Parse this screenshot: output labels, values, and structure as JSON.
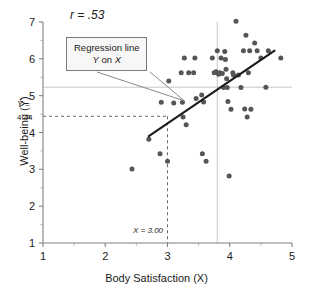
{
  "chart_data": {
    "type": "scatter",
    "title": "",
    "xlabel": "Body Satisfaction (X)",
    "ylabel": "Well-being (Y)",
    "xlim": [
      1,
      5
    ],
    "ylim": [
      1,
      7
    ],
    "xticks": [
      "1",
      "2",
      "3",
      "4",
      "5"
    ],
    "yticks": [
      "1",
      "2",
      "3",
      "4",
      "5",
      "6",
      "7"
    ],
    "grid": false,
    "legend": "none",
    "correlation_label": "r = .53",
    "correlation_value": 0.53,
    "annotations": {
      "callout_line1": "Regression line",
      "callout_line2_prefix": "Y",
      "callout_line2_mid": " on ",
      "callout_line2_suffix": "X",
      "yhat_label": "Ŷ =",
      "yhat_value": "4.44",
      "x_label": "X = 3.00",
      "x_value": 3.0,
      "yhat_numeric": 4.44
    },
    "reference_lines": {
      "dashed_vertical_x": 3.0,
      "dashed_horizontal_y": 4.44,
      "gray_vertical_x": 3.8,
      "gray_horizontal_y": 5.23
    },
    "regression_line": {
      "x_start": 2.7,
      "y_start": 3.9,
      "x_end": 4.72,
      "y_end": 6.22
    },
    "points": [
      [
        2.43,
        3.01
      ],
      [
        2.7,
        3.82
      ],
      [
        2.88,
        3.42
      ],
      [
        2.9,
        4.82
      ],
      [
        3.0,
        3.22
      ],
      [
        3.02,
        5.4
      ],
      [
        3.22,
        5.62
      ],
      [
        3.24,
        4.82
      ],
      [
        3.25,
        4.42
      ],
      [
        3.27,
        6.02
      ],
      [
        3.3,
        4.21
      ],
      [
        3.42,
        5.62
      ],
      [
        3.44,
        6.02
      ],
      [
        3.46,
        4.92
      ],
      [
        3.55,
        5.02
      ],
      [
        3.56,
        3.42
      ],
      [
        3.58,
        4.83
      ],
      [
        3.62,
        3.22
      ],
      [
        3.72,
        6.02
      ],
      [
        3.75,
        5.62
      ],
      [
        3.78,
        5.65
      ],
      [
        3.8,
        6.22
      ],
      [
        3.82,
        5.58
      ],
      [
        3.86,
        6.02
      ],
      [
        3.88,
        5.6
      ],
      [
        3.9,
        5.22
      ],
      [
        3.92,
        6.2
      ],
      [
        3.93,
        5.98
      ],
      [
        3.94,
        5.72
      ],
      [
        3.95,
        5.46
      ],
      [
        3.96,
        5.22
      ],
      [
        3.97,
        4.84
      ],
      [
        3.99,
        2.82
      ],
      [
        4.02,
        4.63
      ],
      [
        4.05,
        5.62
      ],
      [
        4.1,
        7.02
      ],
      [
        4.14,
        5.56
      ],
      [
        4.18,
        5.22
      ],
      [
        4.22,
        6.22
      ],
      [
        4.24,
        4.64
      ],
      [
        4.26,
        6.64
      ],
      [
        4.28,
        4.42
      ],
      [
        4.3,
        5.62
      ],
      [
        4.32,
        6.22
      ],
      [
        4.34,
        4.63
      ],
      [
        4.4,
        6.43
      ],
      [
        4.44,
        6.22
      ],
      [
        4.5,
        6.02
      ],
      [
        4.58,
        5.23
      ],
      [
        4.62,
        6.22
      ],
      [
        4.82,
        6.02
      ],
      [
        3.34,
        5.62
      ],
      [
        3.1,
        4.8
      ],
      [
        4.06,
        5.56
      ],
      [
        3.84,
        5.62
      ]
    ]
  }
}
